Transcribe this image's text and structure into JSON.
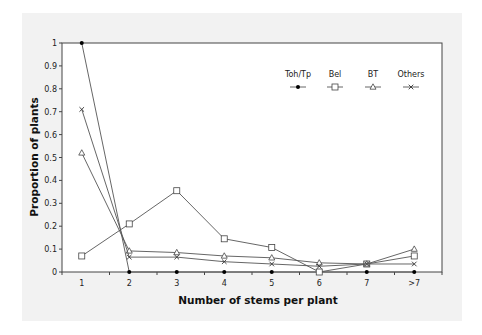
{
  "chart_data": {
    "type": "line",
    "title": "",
    "xlabel": "Number of stems per plant",
    "ylabel": "Proportion of plants",
    "categories": [
      "1",
      "2",
      "3",
      "4",
      "5",
      "6",
      "7",
      ">7"
    ],
    "ylim": [
      0,
      1
    ],
    "yticks": [
      "0",
      "0.1",
      "0.2",
      "0.3",
      "0.4",
      "0.5",
      "0.6",
      "0.7",
      "0.8",
      "0.9",
      "1"
    ],
    "grid": false,
    "legend_position": "top-right",
    "series": [
      {
        "name": "Toh/Tp",
        "marker": "filled-circle",
        "values": [
          1.0,
          0.0,
          0.0,
          0.0,
          0.0,
          0.0,
          0.0,
          0.0
        ]
      },
      {
        "name": "Bel",
        "marker": "open-square",
        "values": [
          0.07,
          0.21,
          0.355,
          0.145,
          0.107,
          0.0,
          0.035,
          0.07
        ]
      },
      {
        "name": "BT",
        "marker": "open-triangle",
        "values": [
          0.52,
          0.092,
          0.085,
          0.07,
          0.062,
          0.04,
          0.035,
          0.1
        ]
      },
      {
        "name": "Others",
        "marker": "cross",
        "values": [
          0.71,
          0.065,
          0.065,
          0.045,
          0.035,
          0.025,
          0.035,
          0.035
        ]
      }
    ]
  }
}
